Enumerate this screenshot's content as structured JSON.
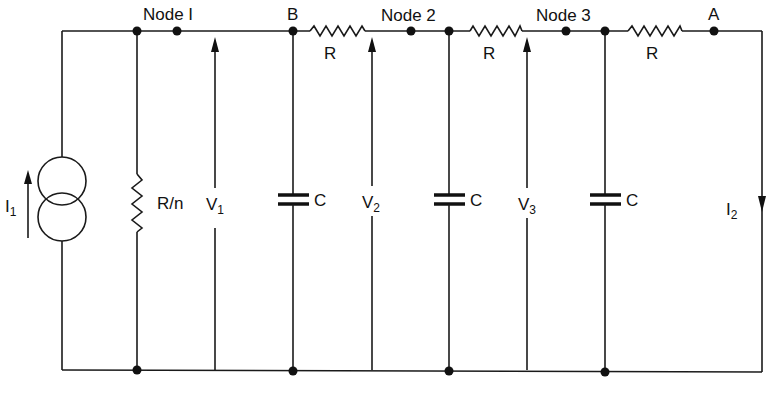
{
  "diagram": {
    "type": "RC ladder network with current source",
    "nodes": [
      {
        "id": "node1",
        "label": "Node I"
      },
      {
        "id": "B",
        "label": "B"
      },
      {
        "id": "node2",
        "label": "Node 2"
      },
      {
        "id": "node3",
        "label": "Node 3"
      },
      {
        "id": "A",
        "label": "A"
      }
    ],
    "source": {
      "label": "I",
      "subscript": "1"
    },
    "shunt_resistor": {
      "label": "R/n"
    },
    "series_resistors": [
      {
        "label": "R"
      },
      {
        "label": "R"
      },
      {
        "label": "R"
      }
    ],
    "capacitors": [
      {
        "label": "C"
      },
      {
        "label": "C"
      },
      {
        "label": "C"
      }
    ],
    "voltages": [
      {
        "label": "V",
        "subscript": "1"
      },
      {
        "label": "V",
        "subscript": "2"
      },
      {
        "label": "V",
        "subscript": "3"
      }
    ],
    "output_current": {
      "label": "I",
      "subscript": "2"
    }
  }
}
